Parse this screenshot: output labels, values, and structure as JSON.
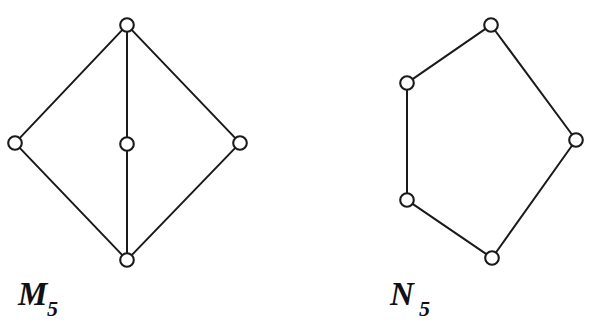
{
  "figure": {
    "background_color": "#ffffff",
    "ink_color": "#1a1a1a",
    "stroke_width": 2,
    "node_radius": 6.8,
    "node_fill": "#ffffff"
  },
  "diagrams": [
    {
      "id": "m5",
      "name": "M5 lattice diagram",
      "label_base": "M",
      "label_subscript": "5",
      "label_x": 18,
      "label_y": 305,
      "label_sub_x": 47,
      "label_sub_y": 316,
      "vertices": [
        {
          "id": "m5-top",
          "name": "top-vertex",
          "x": 127,
          "y": 25
        },
        {
          "id": "m5-left",
          "name": "left-vertex",
          "x": 15,
          "y": 143
        },
        {
          "id": "m5-center",
          "name": "center-vertex",
          "x": 127,
          "y": 144
        },
        {
          "id": "m5-right",
          "name": "right-vertex",
          "x": 240,
          "y": 143
        },
        {
          "id": "m5-bottom",
          "name": "bottom-vertex",
          "x": 127,
          "y": 260
        }
      ],
      "edges": [
        {
          "from": "m5-top",
          "to": "m5-left"
        },
        {
          "from": "m5-top",
          "to": "m5-center"
        },
        {
          "from": "m5-top",
          "to": "m5-right"
        },
        {
          "from": "m5-left",
          "to": "m5-bottom"
        },
        {
          "from": "m5-center",
          "to": "m5-bottom"
        },
        {
          "from": "m5-right",
          "to": "m5-bottom"
        }
      ]
    },
    {
      "id": "n5",
      "name": "N5 lattice diagram",
      "label_base": "N",
      "label_subscript": "5",
      "label_x": 390,
      "label_y": 305,
      "label_sub_x": 419,
      "label_sub_y": 316,
      "vertices": [
        {
          "id": "n5-top",
          "name": "top-vertex",
          "x": 491,
          "y": 25
        },
        {
          "id": "n5-upper-left",
          "name": "upper-left-vertex",
          "x": 407,
          "y": 83
        },
        {
          "id": "n5-right",
          "name": "right-vertex",
          "x": 576,
          "y": 140
        },
        {
          "id": "n5-lower-left",
          "name": "lower-left-vertex",
          "x": 407,
          "y": 200
        },
        {
          "id": "n5-bottom",
          "name": "bottom-vertex",
          "x": 492,
          "y": 258
        }
      ],
      "edges": [
        {
          "from": "n5-top",
          "to": "n5-upper-left"
        },
        {
          "from": "n5-top",
          "to": "n5-right"
        },
        {
          "from": "n5-upper-left",
          "to": "n5-lower-left"
        },
        {
          "from": "n5-lower-left",
          "to": "n5-bottom"
        },
        {
          "from": "n5-bottom",
          "to": "n5-right"
        }
      ]
    }
  ]
}
